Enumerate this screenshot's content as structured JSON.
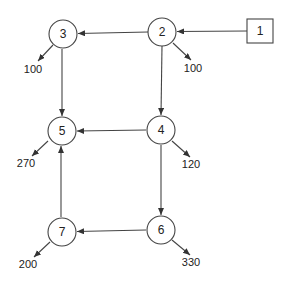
{
  "nodes": [
    {
      "id": "1",
      "label": "1",
      "shape": "square",
      "cx": 260,
      "cy": 31
    },
    {
      "id": "2",
      "label": "2",
      "shape": "circle",
      "cx": 162,
      "cy": 32
    },
    {
      "id": "3",
      "label": "3",
      "shape": "circle",
      "cx": 63,
      "cy": 34
    },
    {
      "id": "4",
      "label": "4",
      "shape": "circle",
      "cx": 161,
      "cy": 130
    },
    {
      "id": "5",
      "label": "5",
      "shape": "circle",
      "cx": 62,
      "cy": 131
    },
    {
      "id": "6",
      "label": "6",
      "shape": "circle",
      "cx": 161,
      "cy": 230
    },
    {
      "id": "7",
      "label": "7",
      "shape": "circle",
      "cx": 62,
      "cy": 232
    }
  ],
  "edges": [
    {
      "from": "1",
      "to": "2"
    },
    {
      "from": "2",
      "to": "3"
    },
    {
      "from": "2",
      "to": "4"
    },
    {
      "from": "3",
      "to": "5"
    },
    {
      "from": "4",
      "to": "5"
    },
    {
      "from": "4",
      "to": "6"
    },
    {
      "from": "6",
      "to": "7"
    },
    {
      "from": "7",
      "to": "5"
    }
  ],
  "outflows": [
    {
      "node": "3",
      "value": "100"
    },
    {
      "node": "2",
      "value": "100"
    },
    {
      "node": "5",
      "value": "270"
    },
    {
      "node": "4",
      "value": "120"
    },
    {
      "node": "7",
      "value": "200"
    },
    {
      "node": "6",
      "value": "330"
    }
  ],
  "colors": {
    "stroke": "#333333",
    "text": "#222222"
  }
}
